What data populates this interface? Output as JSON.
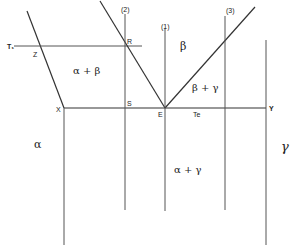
{
  "diagram": {
    "type": "phase-diagram-schematic",
    "labels": {
      "T1": "T₁",
      "Z": "Z",
      "R": "R",
      "S": "S",
      "X": "X",
      "E": "E",
      "Te": "Te",
      "Y": "Y",
      "line1": "(1)",
      "line2": "(2)",
      "line3": "(3)"
    },
    "regions": {
      "alpha_beta": "α + β",
      "beta": "β",
      "beta_gamma": "β + γ",
      "alpha": "α",
      "alpha_gamma": "α + γ",
      "gamma": "γ"
    },
    "colors": {
      "line": "#333333",
      "text": "#222222",
      "background": "#ffffff"
    }
  }
}
